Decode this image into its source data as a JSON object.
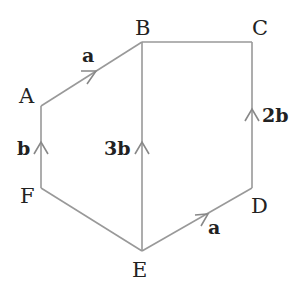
{
  "diagram": {
    "type": "vector hexagon",
    "points": [
      {
        "id": "A",
        "label": "A",
        "x": 41,
        "y": 106
      },
      {
        "id": "B",
        "label": "B",
        "x": 142,
        "y": 42
      },
      {
        "id": "C",
        "label": "C",
        "x": 252,
        "y": 42
      },
      {
        "id": "D",
        "label": "D",
        "x": 252,
        "y": 188
      },
      {
        "id": "E",
        "label": "E",
        "x": 142,
        "y": 251
      },
      {
        "id": "F",
        "label": "F",
        "x": 41,
        "y": 188
      }
    ],
    "edges": [
      {
        "from": "A",
        "to": "B",
        "vector": "a"
      },
      {
        "from": "B",
        "to": "C",
        "vector": ""
      },
      {
        "from": "D",
        "to": "C",
        "vector": "2b"
      },
      {
        "from": "E",
        "to": "D",
        "vector": "a"
      },
      {
        "from": "F",
        "to": "E",
        "vector": ""
      },
      {
        "from": "F",
        "to": "A",
        "vector": "b"
      },
      {
        "from": "E",
        "to": "B",
        "vector": "3b"
      }
    ],
    "labels": {
      "A": "A",
      "B": "B",
      "C": "C",
      "D": "D",
      "E": "E",
      "F": "F",
      "AB": "a",
      "FA": "b",
      "EB": "3b",
      "DC": "2b",
      "ED": "a"
    }
  }
}
